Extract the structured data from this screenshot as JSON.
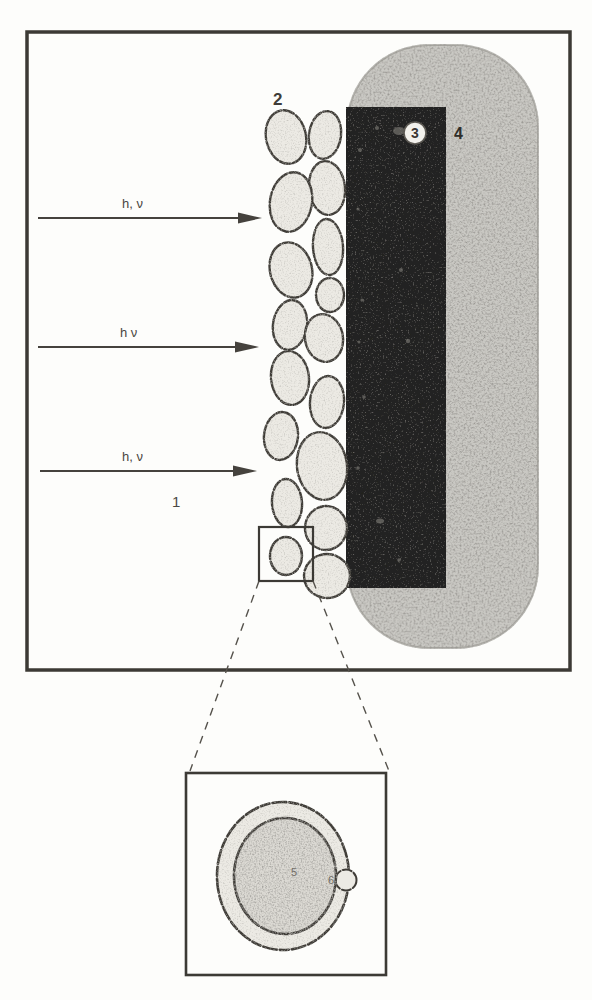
{
  "figure": {
    "labels": {
      "particle_layer": "2",
      "electrode_badge": "3",
      "support_body": "4",
      "beam_region": "1",
      "photon_1": "h, ν",
      "photon_2": "h ν",
      "photon_3": "h, ν",
      "inset_core": "5",
      "inset_shell": "6"
    },
    "colors": {
      "paper": "#fdfdfb",
      "ink": "#3c3a35",
      "electrode_dark": "#242220",
      "stipple_gray": "#c9c8c3",
      "particle_fill": "#eceae4",
      "core_fill": "#dbd9d3",
      "badge_fill": "#f2f1ec"
    }
  }
}
